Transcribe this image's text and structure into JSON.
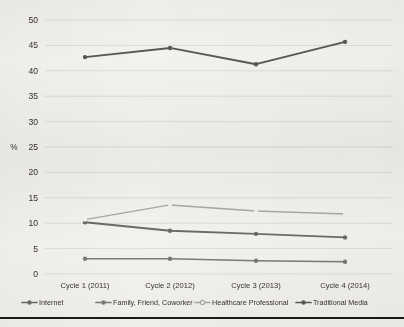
{
  "chart_data": {
    "type": "line",
    "title": "",
    "subtitle": "",
    "xlabel": "",
    "ylabel": "%",
    "ylim": [
      0,
      50
    ],
    "ytick_step": 5,
    "yticks": [
      "0",
      "5",
      "10",
      "15",
      "20",
      "25",
      "30",
      "35",
      "40",
      "45",
      "50"
    ],
    "grid": true,
    "legend_position": "bottom",
    "categories": [
      "Cycle 1 (2011)",
      "Cycle 2 (2012)",
      "Cycle 3 (2013)",
      "Cycle 4 (2014)"
    ],
    "series": [
      {
        "name": "Internet",
        "color": "#6b6b6b",
        "marker": "circle",
        "values": [
          10.2,
          8.5,
          7.9,
          7.2
        ]
      },
      {
        "name": "Family, Friend, Coworker",
        "color": "#7a7a7a",
        "marker": "circle",
        "values": [
          3.0,
          3.0,
          2.6,
          2.4
        ]
      },
      {
        "name": "Healthcare Professional",
        "color": "#a8a8a8",
        "marker": "circle-open",
        "values": [
          10.7,
          13.6,
          12.4,
          11.8
        ]
      },
      {
        "name": "Traditional Media",
        "color": "#585858",
        "marker": "circle",
        "values": [
          42.7,
          44.5,
          41.3,
          45.7
        ]
      }
    ]
  },
  "legend": {
    "items": [
      {
        "label": "Internet"
      },
      {
        "label": "Family, Friend, Coworker"
      },
      {
        "label": "Healthcare Professional"
      },
      {
        "label": "Traditional Media"
      }
    ]
  },
  "colors": {
    "grid": "#d8d6d2",
    "text": "#35322e",
    "background": "#f3f2ef",
    "rule": "#1a1a1a"
  }
}
